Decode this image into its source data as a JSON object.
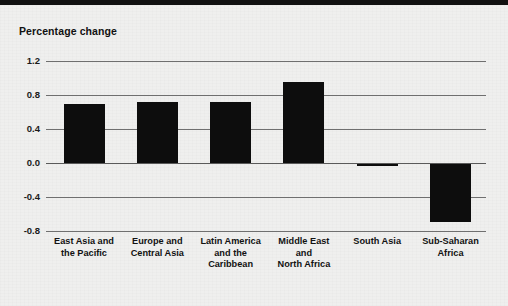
{
  "chart_data": {
    "type": "bar",
    "title": "Percentage change",
    "xlabel": "",
    "ylabel": "Percentage change",
    "ylim": [
      -0.8,
      1.2
    ],
    "yticks": [
      "1.2",
      "0.8",
      "0.4",
      "0.0",
      "-0.4",
      "-0.8"
    ],
    "ytick_values": [
      1.2,
      0.8,
      0.4,
      0.0,
      -0.4,
      -0.8
    ],
    "grid": true,
    "legend": "none",
    "bar_color": "#0d0d0d",
    "categories": [
      "East Asia and the Pacific",
      "Europe and Central Asia",
      "Latin America and the Caribbean",
      "Middle East and North Africa",
      "South Asia",
      "Sub-Saharan Africa"
    ],
    "category_lines": [
      [
        "East Asia and",
        "the Pacific"
      ],
      [
        "Europe and",
        "Central Asia"
      ],
      [
        "Latin America",
        "and the",
        "Caribbean"
      ],
      [
        "Middle East",
        "and",
        "North Africa"
      ],
      [
        "South Asia"
      ],
      [
        "Sub-Saharan",
        "Africa"
      ]
    ],
    "values": [
      0.7,
      0.72,
      0.72,
      0.95,
      -0.02,
      -0.68
    ]
  },
  "colors": {
    "background": "#efefee",
    "bar": "#0d0d0d",
    "gridline": "#6f6f6f",
    "text": "#111111",
    "top_band": "#111111"
  }
}
